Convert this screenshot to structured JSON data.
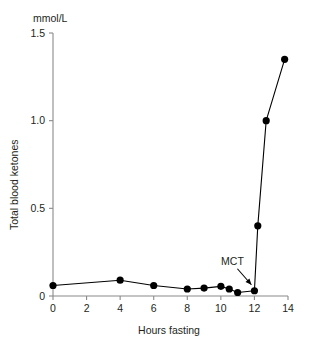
{
  "chart_data": {
    "type": "line",
    "title": "",
    "subtitle": "",
    "unit_label": "mmol/L",
    "xlabel": "Hours fasting",
    "ylabel": "Total blood ketones",
    "xlim": [
      0,
      14
    ],
    "ylim": [
      0,
      1.5
    ],
    "xticks": [
      0,
      2,
      4,
      6,
      8,
      10,
      12,
      14
    ],
    "xtick_labels": [
      "0",
      "2",
      "4",
      "6",
      "8",
      "10",
      "12",
      "14"
    ],
    "yticks": [
      0,
      0.5,
      1.0,
      1.5
    ],
    "ytick_labels": [
      "0",
      "0.5",
      "1.0",
      "1.5"
    ],
    "grid": false,
    "legend": null,
    "series": [
      {
        "name": "Total blood ketones",
        "color": "#000000",
        "marker": "filled-circle",
        "x": [
          0,
          4,
          6,
          8,
          9,
          10,
          10.5,
          11,
          12,
          12.2,
          12.7,
          13.8
        ],
        "y": [
          0.06,
          0.09,
          0.06,
          0.04,
          0.045,
          0.055,
          0.04,
          0.02,
          0.03,
          0.4,
          1.0,
          1.35
        ]
      }
    ],
    "annotations": [
      {
        "text": "MCT",
        "points_to_x": 12,
        "points_to_y": 0.03,
        "arrow": true
      }
    ]
  }
}
